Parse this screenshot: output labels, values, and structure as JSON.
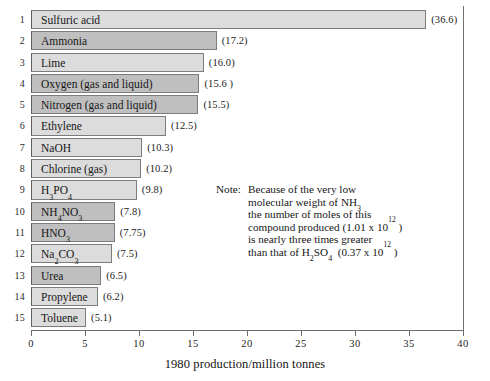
{
  "chart_data": {
    "type": "bar",
    "orientation": "horizontal",
    "title": "",
    "xlabel": "1980 production/million tonnes",
    "ylabel": "",
    "xlim": [
      0,
      40
    ],
    "xticks": [
      0,
      5,
      10,
      15,
      20,
      25,
      30,
      35,
      40
    ],
    "grid": false,
    "legend": null,
    "categories": [
      "Sulfuric acid",
      "Ammonia",
      "Lime",
      "Oxygen (gas and liquid)",
      "Nitrogen (gas and liquid)",
      "Ethylene",
      "NaOH",
      "Chlorine (gas)",
      "H3PO4",
      "NH4NO3",
      "HNO3",
      "Na2CO3",
      "Urea",
      "Propylene",
      "Toluene"
    ],
    "values": [
      36.6,
      17.2,
      16.0,
      15.6,
      15.5,
      12.5,
      10.3,
      10.2,
      9.8,
      7.8,
      7.75,
      7.5,
      6.5,
      6.2,
      5.1
    ],
    "value_labels": [
      "(36.6)",
      "(17.2)",
      "(16.0)",
      "(15.6 )",
      "(15.5)",
      "(12.5)",
      "(10.3)",
      "(10.2)",
      "(9.8)",
      "(7.8)",
      "(7.75)",
      "(7.5)",
      "(6.5)",
      "(6.2)",
      "(5.1)"
    ],
    "rank_labels": [
      "1",
      "2",
      "3",
      "4",
      "5",
      "6",
      "7",
      "8",
      "9",
      "10",
      "11",
      "12",
      "13",
      "14",
      "15"
    ],
    "colors": {
      "bar_light": "#dcdcdc",
      "bar_dark": "#bfbfbf",
      "bar_border": "#7c7c7c",
      "axis": "#6e6e6e",
      "text": "#161616",
      "background": "#ffffff"
    },
    "annotations": [
      {
        "name": "low-molecular-weight-note",
        "head": "Note:",
        "lines": [
          "Because of the very low",
          "molecular weight of NH3",
          "the number of moles of this",
          "compound produced (1.01 x 10^12 )",
          "is nearly three times greater",
          "than that of H2SO4  (0.37 x 10^12 )"
        ]
      }
    ]
  },
  "rows": [
    {
      "rank": "1",
      "name_html": "Sulfuric acid",
      "value": 36.6,
      "value_label": "(36.6)",
      "tone": "light"
    },
    {
      "rank": "2",
      "name_html": "Ammonia",
      "value": 17.2,
      "value_label": "(17.2)",
      "tone": "dark"
    },
    {
      "rank": "3",
      "name_html": "Lime",
      "value": 16.0,
      "value_label": "(16.0)",
      "tone": "light"
    },
    {
      "rank": "4",
      "name_html": "Oxygen (gas and liquid)",
      "value": 15.6,
      "value_label": "(15.6 )",
      "tone": "dark"
    },
    {
      "rank": "5",
      "name_html": "Nitrogen (gas and liquid)",
      "value": 15.5,
      "value_label": "(15.5)",
      "tone": "dark"
    },
    {
      "rank": "6",
      "name_html": "Ethylene",
      "value": 12.5,
      "value_label": "(12.5)",
      "tone": "light"
    },
    {
      "rank": "7",
      "name_html": "NaOH",
      "value": 10.3,
      "value_label": "(10.3)",
      "tone": "light"
    },
    {
      "rank": "8",
      "name_html": "Chlorine (gas)",
      "value": 10.2,
      "value_label": "(10.2)",
      "tone": "light"
    },
    {
      "rank": "9",
      "name_html": "H<sub>3</sub>PO<sub>4</sub>",
      "value": 9.8,
      "value_label": "(9.8)",
      "tone": "light"
    },
    {
      "rank": "10",
      "name_html": "NH<sub>4</sub>NO<sub>3</sub>",
      "value": 7.8,
      "value_label": "(7.8)",
      "tone": "dark"
    },
    {
      "rank": "11",
      "name_html": "HNO<sub>3</sub>",
      "value": 7.75,
      "value_label": "(7.75)",
      "tone": "dark"
    },
    {
      "rank": "12",
      "name_html": "Na<sub>2</sub>CO<sub>3</sub>",
      "value": 7.5,
      "value_label": "(7.5)",
      "tone": "light"
    },
    {
      "rank": "13",
      "name_html": "Urea",
      "value": 6.5,
      "value_label": "(6.5)",
      "tone": "dark"
    },
    {
      "rank": "14",
      "name_html": "Propylene",
      "value": 6.2,
      "value_label": "(6.2)",
      "tone": "light"
    },
    {
      "rank": "15",
      "name_html": "Toluene",
      "value": 5.1,
      "value_label": "(5.1)",
      "tone": "light"
    }
  ],
  "axis": {
    "ticks": [
      "0",
      "5",
      "10",
      "15",
      "20",
      "25",
      "30",
      "35",
      "40"
    ],
    "tick_values": [
      0,
      5,
      10,
      15,
      20,
      25,
      30,
      35,
      40
    ],
    "title": "1980 production/million tonnes"
  },
  "note": {
    "head": "Note:",
    "lines_html": [
      "Because of the very low",
      "molecular weight of NH<sub>3</sub>",
      "the number of moles of this",
      "compound produced (1.01 x 10<sup>12</sup> )",
      "is nearly three times greater",
      "than that of H<sub>2</sub>SO<sub>4</sub>&nbsp; (0.37 x 10<sup>12</sup> )"
    ]
  }
}
